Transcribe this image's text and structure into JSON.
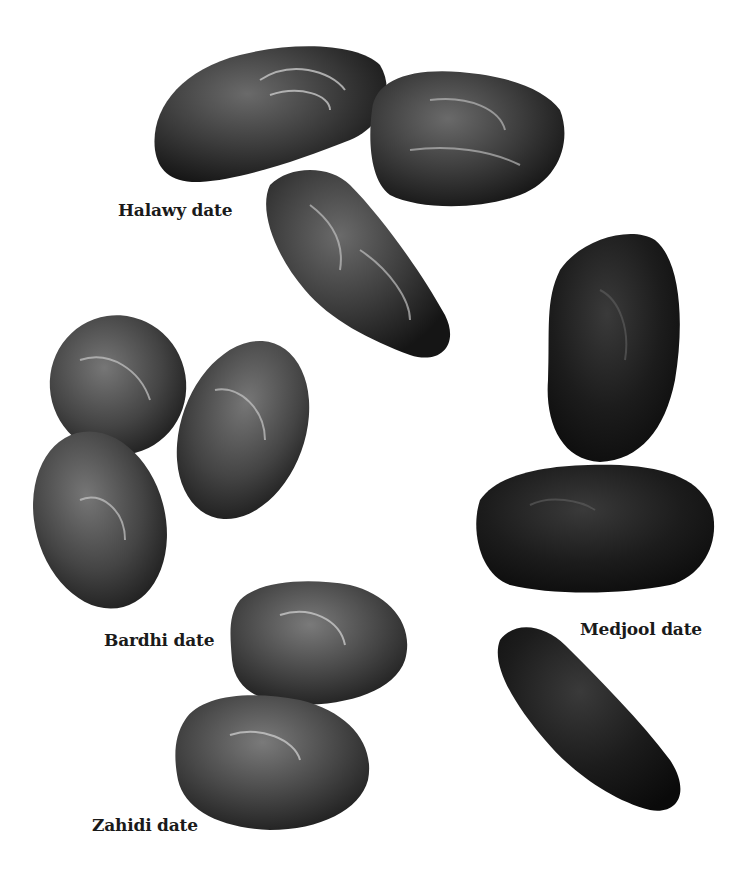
{
  "illustration": {
    "subject": "Date fruit varieties",
    "colors": {
      "background": "#ffffff",
      "label": "#1a1a1a",
      "fruit_dark": "#1c1c1c",
      "fruit_mid": "#3a3a3a",
      "fruit_light": "#5a5a5a",
      "highlight": "#b8b8b8"
    },
    "groups": [
      {
        "id": "halawy",
        "label": "Halawy date",
        "count": 3
      },
      {
        "id": "bardhi",
        "label": "Bardhi date",
        "count": 3
      },
      {
        "id": "medjool",
        "label": "Medjool date",
        "count": 3
      },
      {
        "id": "zahidi",
        "label": "Zahidi date",
        "count": 2
      }
    ]
  }
}
